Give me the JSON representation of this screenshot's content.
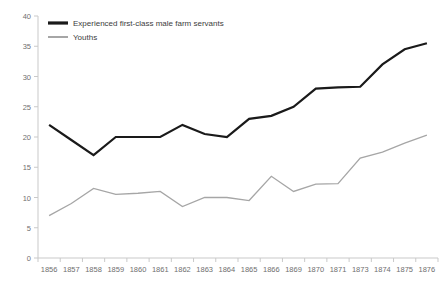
{
  "chart_data": {
    "type": "line",
    "title": "",
    "xlabel": "",
    "ylabel": "",
    "ylim": [
      0,
      40
    ],
    "ytick_step": 5,
    "yticks": [
      "0",
      "5",
      "10",
      "15",
      "20",
      "25",
      "30",
      "35",
      "40"
    ],
    "grid": false,
    "legend_position": "top-left",
    "categories": [
      "1856",
      "1857",
      "1858",
      "1859",
      "1860",
      "1861",
      "1862",
      "1863",
      "1864",
      "1865",
      "1866",
      "1869",
      "1870",
      "1871",
      "1873",
      "1874",
      "1875",
      "1876"
    ],
    "series": [
      {
        "name": "Experienced first-class male farm servants",
        "color": "#1a1a1a",
        "width": 2.2,
        "values": [
          22,
          19.5,
          17,
          20,
          20,
          20,
          22,
          20.5,
          20,
          23,
          23.5,
          25,
          28,
          28.2,
          28.3,
          32,
          34.5,
          35.5
        ]
      },
      {
        "name": "Youths",
        "color": "#a6a6a6",
        "width": 1.3,
        "values": [
          7,
          9,
          11.5,
          10.5,
          10.7,
          11,
          8.5,
          10,
          10,
          9.5,
          13.5,
          11,
          12.2,
          12.3,
          16.5,
          17.5,
          19,
          20.3
        ]
      }
    ]
  },
  "legend": {
    "items": [
      {
        "label": "Experienced first-class male farm servants"
      },
      {
        "label": "Youths"
      }
    ]
  }
}
